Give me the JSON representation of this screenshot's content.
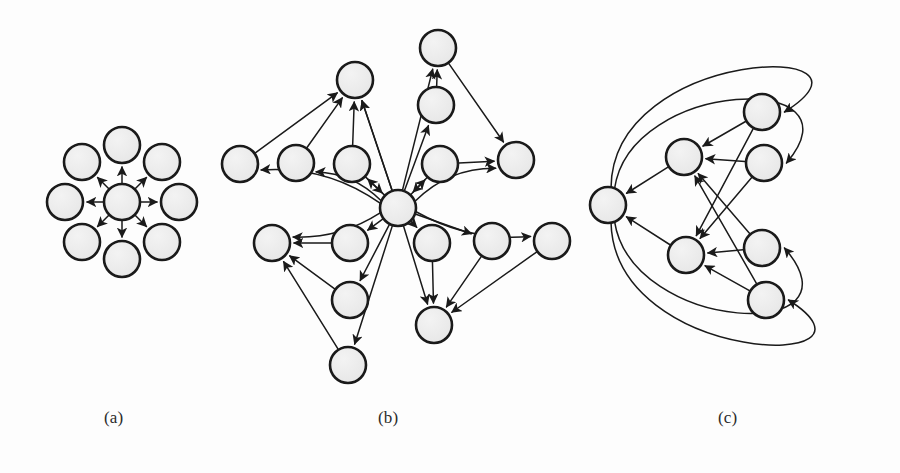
{
  "figure": {
    "type": "diagram",
    "subtype": "directed-graph-panels",
    "background_color": "#fdfdfd",
    "node_fill": "#ebebeb",
    "node_stroke": "#1a1a1a",
    "edge_stroke": "#1a1a1a",
    "node_radius": 18,
    "node_stroke_width": 2.6,
    "edge_stroke_width": 1.5,
    "caption_color": "#2b2b2b"
  },
  "panels": [
    {
      "id": "a",
      "caption": "(a)",
      "description": "star graph: one hub with eight leaves, all edges directed outward from hub",
      "node_count": 9,
      "edge_count": 8,
      "nodes": [
        {
          "id": "a0",
          "role": "hub",
          "x": 122,
          "y": 202
        },
        {
          "id": "a1",
          "role": "leaf",
          "x": 122,
          "y": 145
        },
        {
          "id": "a2",
          "role": "leaf",
          "x": 162,
          "y": 162
        },
        {
          "id": "a3",
          "role": "leaf",
          "x": 179,
          "y": 202
        },
        {
          "id": "a4",
          "role": "leaf",
          "x": 162,
          "y": 242
        },
        {
          "id": "a5",
          "role": "leaf",
          "x": 122,
          "y": 259
        },
        {
          "id": "a6",
          "role": "leaf",
          "x": 82,
          "y": 242
        },
        {
          "id": "a7",
          "role": "leaf",
          "x": 65,
          "y": 202
        },
        {
          "id": "a8",
          "role": "leaf",
          "x": 82,
          "y": 162
        }
      ],
      "edges": [
        {
          "from": "a0",
          "to": "a1",
          "curve": 0
        },
        {
          "from": "a0",
          "to": "a2",
          "curve": 0
        },
        {
          "from": "a0",
          "to": "a3",
          "curve": 0
        },
        {
          "from": "a0",
          "to": "a4",
          "curve": 0
        },
        {
          "from": "a0",
          "to": "a5",
          "curve": 0
        },
        {
          "from": "a0",
          "to": "a6",
          "curve": 0
        },
        {
          "from": "a0",
          "to": "a7",
          "curve": 0
        },
        {
          "from": "a0",
          "to": "a8",
          "curve": 0
        }
      ]
    },
    {
      "id": "b",
      "caption": "(b)",
      "description": "large hub-and-spoke graph with sixteen nodes, bidirectional hub edges and peripheral edges",
      "node_count": 16,
      "edge_count": 27,
      "nodes": [
        {
          "id": "b0",
          "role": "hub",
          "x": 398,
          "y": 208
        },
        {
          "id": "b1",
          "role": "peripheral",
          "x": 355,
          "y": 80
        },
        {
          "id": "b2",
          "role": "peripheral",
          "x": 438,
          "y": 48
        },
        {
          "id": "b3",
          "role": "peripheral",
          "x": 436,
          "y": 105
        },
        {
          "id": "b4",
          "role": "peripheral",
          "x": 240,
          "y": 164
        },
        {
          "id": "b5",
          "role": "peripheral",
          "x": 296,
          "y": 163
        },
        {
          "id": "b6",
          "role": "peripheral",
          "x": 352,
          "y": 164
        },
        {
          "id": "b7",
          "role": "peripheral",
          "x": 440,
          "y": 164
        },
        {
          "id": "b8",
          "role": "peripheral",
          "x": 516,
          "y": 160
        },
        {
          "id": "b9",
          "role": "peripheral",
          "x": 272,
          "y": 243
        },
        {
          "id": "b10",
          "role": "peripheral",
          "x": 350,
          "y": 243
        },
        {
          "id": "b11",
          "role": "peripheral",
          "x": 432,
          "y": 243
        },
        {
          "id": "b12",
          "role": "peripheral",
          "x": 492,
          "y": 241
        },
        {
          "id": "b13",
          "role": "peripheral",
          "x": 552,
          "y": 241
        },
        {
          "id": "b14",
          "role": "peripheral",
          "x": 350,
          "y": 300
        },
        {
          "id": "b15",
          "role": "peripheral",
          "x": 348,
          "y": 365
        },
        {
          "id": "b16",
          "role": "peripheral",
          "x": 434,
          "y": 325
        }
      ],
      "edges": [
        {
          "from": "b0",
          "to": "b1",
          "curve": 0
        },
        {
          "from": "b0",
          "to": "b2",
          "curve": 0
        },
        {
          "from": "b0",
          "to": "b3",
          "curve": 0
        },
        {
          "from": "b0",
          "to": "b4",
          "curve": 22
        },
        {
          "from": "b0",
          "to": "b5",
          "curve": 14
        },
        {
          "from": "b0",
          "to": "b6",
          "curve": 0
        },
        {
          "from": "b0",
          "to": "b7",
          "curve": 0
        },
        {
          "from": "b0",
          "to": "b8",
          "curve": -18
        },
        {
          "from": "b0",
          "to": "b9",
          "curve": -14
        },
        {
          "from": "b0",
          "to": "b10",
          "curve": 0
        },
        {
          "from": "b0",
          "to": "b11",
          "curve": 0
        },
        {
          "from": "b0",
          "to": "b12",
          "curve": 0
        },
        {
          "from": "b0",
          "to": "b13",
          "curve": 18
        },
        {
          "from": "b0",
          "to": "b14",
          "curve": 0
        },
        {
          "from": "b0",
          "to": "b15",
          "curve": 0
        },
        {
          "from": "b0",
          "to": "b16",
          "curve": 0
        },
        {
          "from": "b6",
          "to": "b0",
          "curve": 0
        },
        {
          "from": "b7",
          "to": "b0",
          "curve": 0
        },
        {
          "from": "b4",
          "to": "b1",
          "curve": 0
        },
        {
          "from": "b5",
          "to": "b1",
          "curve": 0
        },
        {
          "from": "b6",
          "to": "b1",
          "curve": 0
        },
        {
          "from": "b0",
          "to": "b1",
          "curve": 0
        },
        {
          "from": "b3",
          "to": "b2",
          "curve": 0
        },
        {
          "from": "b2",
          "to": "b8",
          "curve": 0
        },
        {
          "from": "b7",
          "to": "b8",
          "curve": 0
        },
        {
          "from": "b10",
          "to": "b9",
          "curve": 0
        },
        {
          "from": "b14",
          "to": "b9",
          "curve": 0
        },
        {
          "from": "b15",
          "to": "b9",
          "curve": 0
        },
        {
          "from": "b11",
          "to": "b16",
          "curve": 0
        },
        {
          "from": "b12",
          "to": "b16",
          "curve": 0
        },
        {
          "from": "b13",
          "to": "b16",
          "curve": 0
        }
      ]
    },
    {
      "id": "c",
      "caption": "(c)",
      "description": "six-node graph with two sink hubs on the left and long curved feedback edges wrapping around the outside",
      "node_count": 6,
      "edge_count": 14,
      "nodes": [
        {
          "id": "c0",
          "role": "sink",
          "x": 608,
          "y": 205
        },
        {
          "id": "c1",
          "role": "hub",
          "x": 684,
          "y": 157
        },
        {
          "id": "c2",
          "role": "hub",
          "x": 686,
          "y": 255
        },
        {
          "id": "c3",
          "role": "source",
          "x": 762,
          "y": 112
        },
        {
          "id": "c4",
          "role": "source",
          "x": 764,
          "y": 163
        },
        {
          "id": "c5",
          "role": "source",
          "x": 762,
          "y": 248
        },
        {
          "id": "c6",
          "role": "source",
          "x": 766,
          "y": 300
        }
      ],
      "edges": [
        {
          "from": "c1",
          "to": "c0",
          "curve": 0
        },
        {
          "from": "c2",
          "to": "c0",
          "curve": 0
        },
        {
          "from": "c3",
          "to": "c1",
          "curve": 0
        },
        {
          "from": "c4",
          "to": "c1",
          "curve": 0
        },
        {
          "from": "c5",
          "to": "c1",
          "curve": 0
        },
        {
          "from": "c6",
          "to": "c1",
          "curve": 0
        },
        {
          "from": "c3",
          "to": "c2",
          "curve": 0
        },
        {
          "from": "c4",
          "to": "c2",
          "curve": 0
        },
        {
          "from": "c5",
          "to": "c2",
          "curve": 0
        },
        {
          "from": "c6",
          "to": "c2",
          "curve": 0
        },
        {
          "from": "c0",
          "to": "c3",
          "curve": "wrap-top-outer"
        },
        {
          "from": "c0",
          "to": "c4",
          "curve": "wrap-top-inner"
        },
        {
          "from": "c0",
          "to": "c5",
          "curve": "wrap-bottom-inner"
        },
        {
          "from": "c0",
          "to": "c6",
          "curve": "wrap-bottom-outer"
        }
      ]
    }
  ]
}
